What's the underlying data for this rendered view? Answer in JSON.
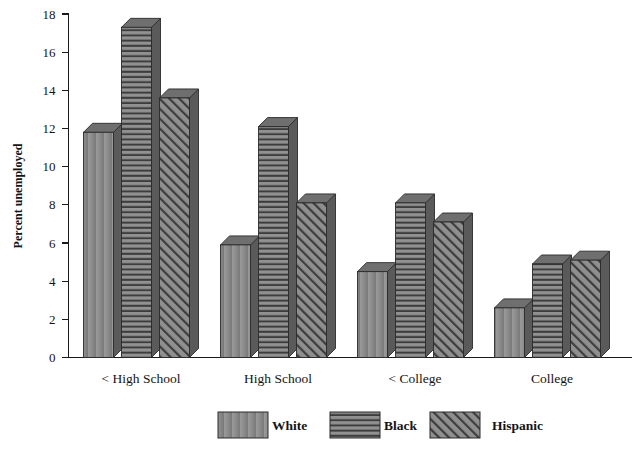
{
  "chart_data": {
    "type": "bar",
    "title": "",
    "subtitle": "",
    "xlabel": "",
    "ylabel": "Percent unemployed",
    "ylim": [
      0,
      18
    ],
    "ytick_step": 2,
    "yticks": [
      "0",
      "2",
      "4",
      "6",
      "8",
      "10",
      "12",
      "14",
      "16",
      "18"
    ],
    "grid": false,
    "legend_position": "bottom",
    "style": "3d-bars",
    "categories": [
      "< High School",
      "High School",
      "< College",
      "College"
    ],
    "series": [
      {
        "name": "White",
        "pattern": "solid",
        "color": "#8b8b8b",
        "values": [
          11.8,
          5.9,
          4.5,
          2.6
        ]
      },
      {
        "name": "Black",
        "pattern": "horizontal-stripes",
        "color": "#8b8b8b",
        "values": [
          17.3,
          12.1,
          8.1,
          4.9
        ]
      },
      {
        "name": "Hispanic",
        "pattern": "diagonal-hatch",
        "color": "#8b8b8b",
        "values": [
          13.6,
          8.1,
          7.1,
          5.1
        ]
      }
    ]
  },
  "legend": {
    "items": [
      {
        "label": "White"
      },
      {
        "label": "Black"
      },
      {
        "label": "Hispanic"
      }
    ]
  },
  "colors": {
    "bar_face": "#8b8b8b",
    "bar_top": "#6f6f6f",
    "bar_side": "#5a5a5a",
    "pattern_line": "#3a3a3a",
    "axis": "#1a1a1a",
    "background": "#ffffff"
  }
}
